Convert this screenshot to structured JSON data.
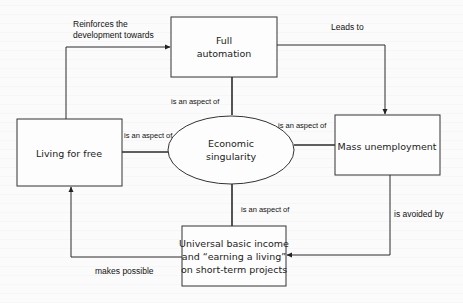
{
  "diagram": {
    "nodes": {
      "full_automation": {
        "lines": [
          "Full",
          "automation"
        ]
      },
      "living_for_free": {
        "lines": [
          "Living for free"
        ]
      },
      "economic_singularity": {
        "lines": [
          "Economic",
          "singularity"
        ]
      },
      "mass_unemployment": {
        "lines": [
          "Mass unemployment"
        ]
      },
      "ubi": {
        "lines": [
          "Universal basic income",
          "and “earning a living”",
          "on short-term projects"
        ]
      }
    },
    "edges": {
      "reinforces": {
        "lines": [
          "Reinforces the",
          "development towards"
        ],
        "from": "Living for free",
        "to": "Full automation"
      },
      "leads_to": {
        "lines": [
          "Leads to"
        ],
        "from": "Full automation",
        "to": "Mass unemployment"
      },
      "fa_aspect": {
        "lines": [
          "is an aspect of"
        ],
        "from": "Full automation",
        "to": "Economic singularity"
      },
      "lff_aspect": {
        "lines": [
          "is an aspect of"
        ],
        "from": "Living for free",
        "to": "Economic singularity"
      },
      "mu_aspect": {
        "lines": [
          "is an aspect of"
        ],
        "from": "Mass unemployment",
        "to": "Economic singularity"
      },
      "ubi_aspect": {
        "lines": [
          "is an aspect of"
        ],
        "from": "Universal basic income",
        "to": "Economic singularity"
      },
      "avoided_by": {
        "lines": [
          "is avoided by"
        ],
        "from": "Mass unemployment",
        "to": "Universal basic income"
      },
      "makes_possible": {
        "lines": [
          "makes possible"
        ],
        "from": "Universal basic income",
        "to": "Living for free"
      }
    }
  }
}
